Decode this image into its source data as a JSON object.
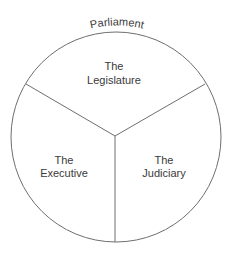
{
  "diagram": {
    "title": "Parliament",
    "sections": [
      {
        "id": "legislature",
        "line1": "The",
        "line2": "Legislature"
      },
      {
        "id": "executive",
        "line1": "The",
        "line2": "Executive"
      },
      {
        "id": "judiciary",
        "line1": "The",
        "line2": "Judiciary"
      }
    ],
    "colors": {
      "stroke": "#6e6e6e",
      "text": "#3a3a3a",
      "background": "#ffffff"
    }
  }
}
